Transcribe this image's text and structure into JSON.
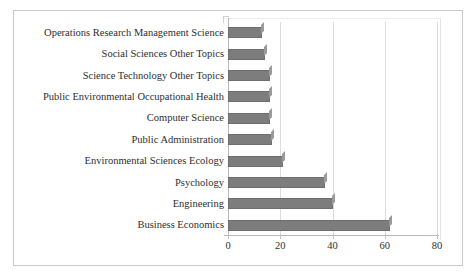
{
  "chart_data": {
    "type": "bar",
    "orientation": "horizontal",
    "title": "",
    "subtitle": "",
    "xlabel": "",
    "ylabel": "",
    "categories": [
      "Business Economics",
      "Engineering",
      "Psychology",
      "Environmental Sciences Ecology",
      "Public Administration",
      "Computer Science",
      "Public Environmental Occupational Health",
      "Science Technology Other Topics",
      "Social Sciences Other Topics",
      "Operations Research Management Science"
    ],
    "values": [
      62,
      40,
      37,
      21,
      17,
      16,
      16,
      16,
      14,
      13
    ],
    "xlim": [
      0,
      80
    ],
    "xticks": [
      0,
      20,
      40,
      60,
      80
    ],
    "xtick_labels": [
      "0",
      "20",
      "40",
      "60",
      "80"
    ],
    "grid": true,
    "grid_axis": "x",
    "legend": "none",
    "bar_color": "#7d7d7d",
    "bar_border_color": "#6e6e6e",
    "plot_border_color": "#c9c9c9",
    "gridline_color": "#dcdcdc",
    "axis_color": "#b9b9b9",
    "background_color": "#ffffff"
  }
}
